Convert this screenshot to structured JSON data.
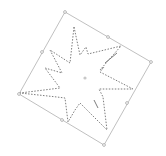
{
  "canvas": {
    "width": 166,
    "height": 156,
    "background": "#ffffff"
  },
  "selection_box": {
    "label": "rotated-selection",
    "stroke": "#b0b0b0",
    "corners": [
      [
        65,
        12
      ],
      [
        151,
        62
      ],
      [
        104,
        145
      ],
      [
        19,
        94
      ]
    ],
    "handles": [
      [
        65,
        12
      ],
      [
        108,
        37
      ],
      [
        151,
        62
      ],
      [
        127,
        103
      ],
      [
        104,
        145
      ],
      [
        62,
        120
      ],
      [
        19,
        94
      ],
      [
        42,
        52
      ]
    ],
    "handle_fill": "#ffffff",
    "handle_stroke": "#8a8a8a"
  },
  "center_pivot": {
    "x": 85,
    "y": 78,
    "color": "#c8c8c8"
  },
  "shape": {
    "type": "star-explosion",
    "stroke": "#6e6e6e",
    "dash": "1.5,1.5",
    "points": [
      [
        74,
        27
      ],
      [
        80,
        55
      ],
      [
        86,
        47
      ],
      [
        88,
        54
      ],
      [
        121,
        46
      ],
      [
        100,
        70
      ],
      [
        104,
        67
      ],
      [
        100,
        72
      ],
      [
        133,
        89
      ],
      [
        99,
        89
      ],
      [
        103,
        97
      ],
      [
        107,
        130
      ],
      [
        80,
        103
      ],
      [
        75,
        110
      ],
      [
        68,
        122
      ],
      [
        65,
        98
      ],
      [
        57,
        97
      ],
      [
        20,
        93
      ],
      [
        60,
        88
      ],
      [
        45,
        68
      ],
      [
        62,
        73
      ],
      [
        50,
        50
      ],
      [
        70,
        63
      ]
    ]
  },
  "extra_strokes": [
    {
      "from": [
        105,
        63
      ],
      "to": [
        117,
        53
      ]
    },
    {
      "from": [
        94,
        100
      ],
      "to": [
        98,
        108
      ]
    }
  ]
}
